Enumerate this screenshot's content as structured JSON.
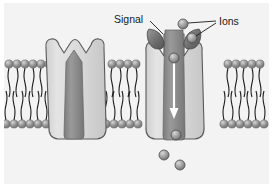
{
  "figure": {
    "background_color": "#f3f3f3",
    "page_color": "#ffffff"
  },
  "labels": {
    "signal": "Signal",
    "ions": "Ions"
  },
  "colors": {
    "membrane_background": "#f3f3f3",
    "lipid_head": "#8e8e8e",
    "lipid_head_highlight": "#c9c9c9",
    "lipid_tail": "#1c1c1c",
    "channel_body": "#dcdcdc",
    "channel_outline": "#5a5a5a",
    "channel_pore": "#8a8a8a",
    "signal_molecule": "#6e6e6e",
    "ion_fill": "#9a9a9a",
    "ion_outline": "#4a4a4a",
    "arrow": "#ffffff",
    "leader_line": "#1a1a1a"
  },
  "channels": [
    {
      "id": "closed-channel",
      "state": "closed",
      "position": "left",
      "has_signal_bound": false,
      "pore_open": false,
      "ions_passing": 0
    },
    {
      "id": "open-channel",
      "state": "open",
      "position": "right",
      "has_signal_bound": true,
      "pore_open": true,
      "ions_passing": 5,
      "flow_direction": "downward"
    }
  ],
  "signal_molecules": [
    {
      "id": "signal-left",
      "bound_to": "open-channel"
    },
    {
      "id": "signal-right",
      "bound_to": "open-channel"
    }
  ],
  "ions": [
    {
      "id": "ion-extracellular-1",
      "region": "extracellular"
    },
    {
      "id": "ion-channel-mouth",
      "region": "channel-mouth"
    },
    {
      "id": "ion-pore-upper",
      "region": "pore"
    },
    {
      "id": "ion-pore-lower",
      "region": "pore"
    },
    {
      "id": "ion-intracellular-1",
      "region": "intracellular"
    },
    {
      "id": "ion-intracellular-2",
      "region": "intracellular"
    }
  ],
  "membrane": {
    "leaflets": 2,
    "outer_leaflet_y": 63,
    "inner_leaflet_y": 124,
    "description": "phospholipid bilayer"
  }
}
